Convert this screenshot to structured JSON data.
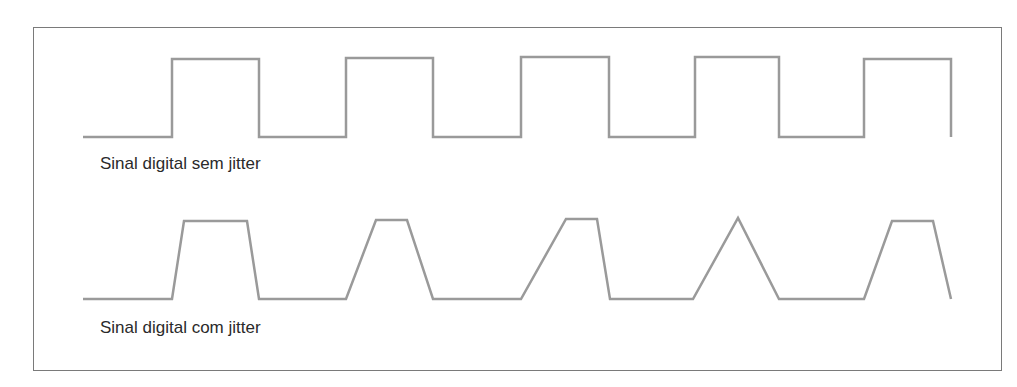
{
  "diagram": {
    "border_color": "#7a7a7a",
    "wave_color": "#9a9a9a",
    "signals": [
      {
        "label": "Sinal digital sem jitter",
        "type": "square",
        "points": [
          [
            83,
            137
          ],
          [
            172,
            137
          ],
          [
            172,
            59
          ],
          [
            259,
            59
          ],
          [
            259,
            137
          ],
          [
            346,
            137
          ],
          [
            346,
            58
          ],
          [
            433,
            58
          ],
          [
            433,
            137
          ],
          [
            521,
            137
          ],
          [
            521,
            57
          ],
          [
            609,
            57
          ],
          [
            609,
            137
          ],
          [
            695,
            137
          ],
          [
            695,
            57
          ],
          [
            779,
            57
          ],
          [
            779,
            137
          ],
          [
            864,
            137
          ],
          [
            864,
            59
          ],
          [
            951,
            59
          ],
          [
            951,
            137
          ]
        ]
      },
      {
        "label": "Sinal digital com jitter",
        "type": "jittered",
        "points": [
          [
            83,
            299
          ],
          [
            172,
            299
          ],
          [
            184,
            221
          ],
          [
            247,
            221
          ],
          [
            259,
            299
          ],
          [
            346,
            299
          ],
          [
            376,
            220
          ],
          [
            407,
            220
          ],
          [
            433,
            299
          ],
          [
            521,
            299
          ],
          [
            566,
            219
          ],
          [
            597,
            219
          ],
          [
            610,
            299
          ],
          [
            693,
            299
          ],
          [
            738,
            218
          ],
          [
            779,
            299
          ],
          [
            864,
            299
          ],
          [
            892,
            221
          ],
          [
            933,
            221
          ],
          [
            951,
            299
          ]
        ]
      }
    ]
  }
}
